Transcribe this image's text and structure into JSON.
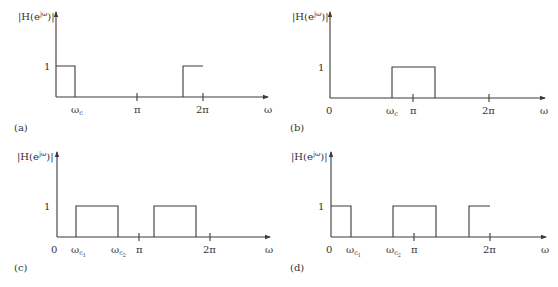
{
  "figure": {
    "panels": [
      {
        "id": "a",
        "caption": "(a)",
        "ylabel": "|H(e^jω)|",
        "xlabel": "ω",
        "one_label": "1",
        "origin_label": "",
        "ticks": [
          "ωc",
          "π",
          "2π"
        ],
        "description": "lowpass: passband 0..ωc and its periodic repeat starting at 2π-ωc up to 2π"
      },
      {
        "id": "b",
        "caption": "(b)",
        "ylabel": "|H(e^jω)|",
        "xlabel": "ω",
        "one_label": "1",
        "origin_label": "0",
        "ticks": [
          "ωc",
          "π",
          "2π"
        ],
        "description": "highpass: passband ωc..2π-ωc"
      },
      {
        "id": "c",
        "caption": "(c)",
        "ylabel": "|H(e^jω)|",
        "xlabel": "ω",
        "one_label": "1",
        "origin_label": "0",
        "ticks": [
          "ωc1",
          "ωc2",
          "π",
          "2π"
        ],
        "description": "bandpass: passbands ωc1..ωc2 and 2π-ωc2..2π-ωc1"
      },
      {
        "id": "d",
        "caption": "(d)",
        "ylabel": "|H(e^jω)|",
        "xlabel": "ω",
        "one_label": "1",
        "origin_label": "0",
        "ticks": [
          "ωc1",
          "ωc2",
          "π",
          "2π"
        ],
        "description": "bandstop: passbands 0..ωc1, ωc2..2π-ωc2, 2π-ωc1..2π"
      }
    ]
  },
  "labels": {
    "a_caption": "(a)",
    "b_caption": "(b)",
    "c_caption": "(c)",
    "d_caption": "(d)",
    "one": "1",
    "zero": "0",
    "omega": "ω",
    "pi": "π",
    "two_pi": "2π",
    "omega_c": "ω",
    "sub_c": "c",
    "sub_c1": "c",
    "sub_c2": "c",
    "sub_1": "1",
    "sub_2": "2",
    "H_prefix": "|H(e",
    "H_sup": "jω",
    "H_suffix": ")|"
  },
  "colors": {
    "line": "#3a3a3a",
    "text": "#333333",
    "background": "#ffffff"
  }
}
